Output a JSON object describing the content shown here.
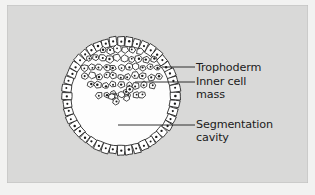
{
  "figure": {
    "kind": "biological-diagram",
    "background_color": "#d9d9d8",
    "page_color": "#f2f2f1",
    "ink_color": "#1b1b1b",
    "cavity_color": "#fdfdfd"
  },
  "labels": [
    {
      "id": "trophoderm",
      "text": "Trophoderm",
      "lines": [
        "Trophoderm"
      ],
      "x": 189,
      "y": 57,
      "leader": {
        "x1": 155,
        "y1": 62,
        "x2": 188,
        "y2": 62
      }
    },
    {
      "id": "inner-cell-mass",
      "text": "Inner cell mass",
      "lines": [
        "Inner cell",
        "mass"
      ],
      "x": 189,
      "y": 71,
      "leader": {
        "x1": 128,
        "y1": 77,
        "x2": 188,
        "y2": 77
      }
    },
    {
      "id": "segmentation-cavity",
      "text": "Segmentation cavity",
      "lines": [
        "Segmentation",
        "cavity"
      ],
      "x": 189,
      "y": 114,
      "leader": {
        "x1": 111,
        "y1": 120,
        "x2": 188,
        "y2": 120
      }
    }
  ],
  "blastocyst": {
    "center_x": 114,
    "center_y": 91,
    "outer_radius": 59,
    "inner_radius": 50,
    "trophoderm_cell_count": 44,
    "inner_cell_mass_cell_count": 60
  }
}
